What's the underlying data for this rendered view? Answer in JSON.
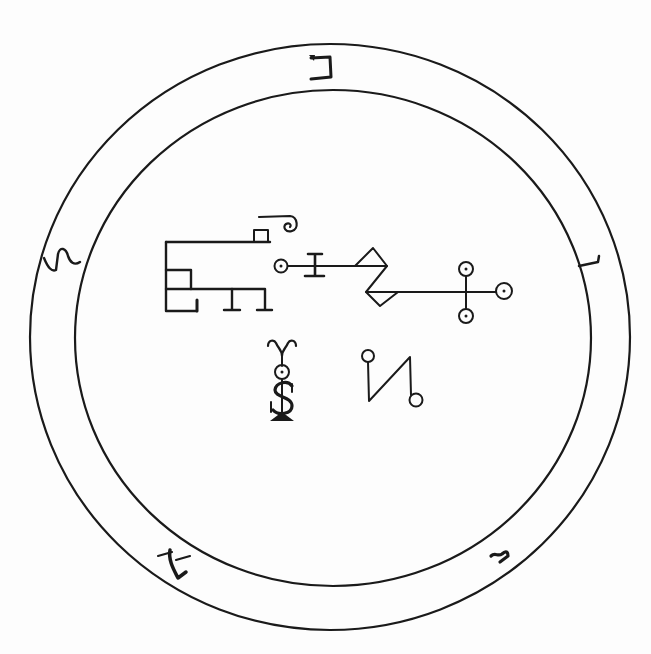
{
  "seal": {
    "title": "Sigil seal",
    "ink_color": "#1a1a1a",
    "background_color": "#fdfdfd",
    "outer_circle": {
      "cx": 330,
      "cy": 337,
      "rx": 300,
      "ry": 293
    },
    "inner_circle": {
      "cx": 333,
      "cy": 338,
      "rx": 258,
      "ry": 248
    },
    "border_glyphs": [
      {
        "position": "top",
        "glyph": "כ"
      },
      {
        "position": "right",
        "glyph": "ʅ"
      },
      {
        "position": "bottom-right",
        "glyph": "ꟾ"
      },
      {
        "position": "bottom-left",
        "glyph": "ℒ"
      },
      {
        "position": "left",
        "glyph": "ᔕ"
      }
    ],
    "central_figures": [
      "bracket-glyph",
      "circle-I-line",
      "zigzag-triangles",
      "cross-with-circles",
      "horned-S-figure",
      "N-with-circles"
    ]
  }
}
